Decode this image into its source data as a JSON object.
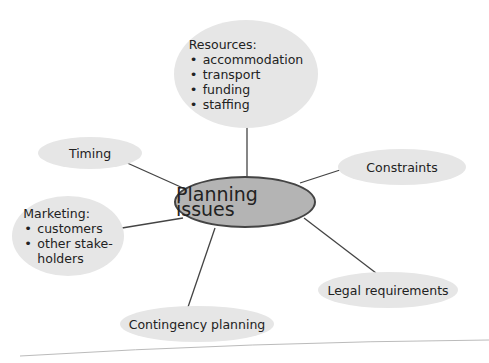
{
  "diagram": {
    "type": "mind-map",
    "center": {
      "label": "Planning issues"
    },
    "nodes": [
      {
        "id": "resources",
        "title": "Resources:",
        "items": [
          "accommodation",
          "transport",
          "funding",
          "staffing"
        ]
      },
      {
        "id": "timing",
        "title": "Timing",
        "items": []
      },
      {
        "id": "constraints",
        "title": "Constraints",
        "items": []
      },
      {
        "id": "marketing",
        "title": "Marketing:",
        "items": [
          "customers",
          "other stake-holders"
        ],
        "items_display": [
          "customers",
          "other stake-",
          "holders"
        ]
      },
      {
        "id": "legal",
        "title": "Legal requirements",
        "items": []
      },
      {
        "id": "contingency",
        "title": "Contingency planning",
        "items": []
      }
    ],
    "colors": {
      "node_fill": "#e6e6e6",
      "center_fill": "#b4b4b4",
      "center_border": "#444444",
      "line": "#444444"
    }
  }
}
